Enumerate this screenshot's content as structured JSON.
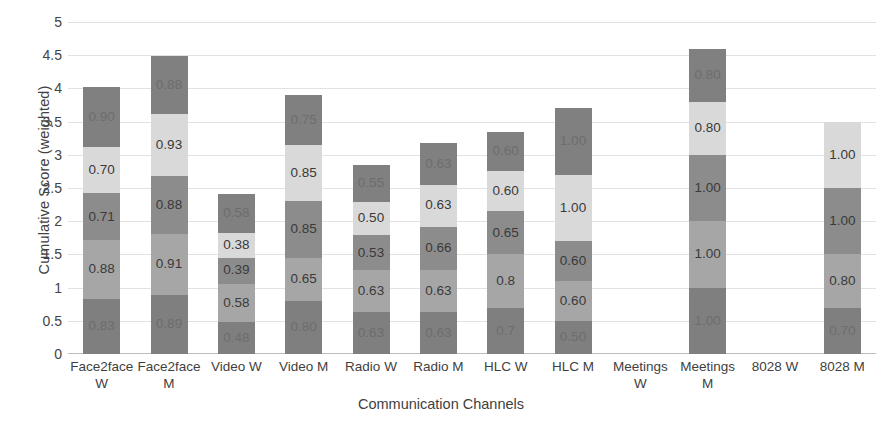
{
  "chart_data": {
    "type": "bar",
    "subtype": "stacked-bar",
    "title": "",
    "xlabel": "Communication Channels",
    "ylabel": "Cumulative Score (weighted)",
    "ylim": [
      0,
      5
    ],
    "ytick_step": 0.5,
    "ytick_labels": [
      "5",
      "4.5",
      "4",
      "3.5",
      "3",
      "2.5",
      "2",
      "1.5",
      "1",
      "0.5",
      "0"
    ],
    "ytick_values": [
      5,
      4.5,
      4,
      3.5,
      3,
      2.5,
      2,
      1.5,
      1,
      0.5,
      0
    ],
    "grid": true,
    "legend": "none",
    "stack_order": "bottom-to-top",
    "series_colors": [
      "#7f7f7f",
      "#a6a6a6",
      "#8c8c8c",
      "#d9d9d9",
      "#808080"
    ],
    "categories": [
      "Face2face W",
      "Face2face M",
      "Video W",
      "Video M",
      "Radio W",
      "Radio M",
      "HLC W",
      "HLC M",
      "Meetings W",
      "Meetings M",
      "8028 W",
      "8028 M"
    ],
    "category_lines": [
      [
        "Face2face",
        "W"
      ],
      [
        "Face2face",
        "M"
      ],
      [
        "Video W"
      ],
      [
        "Video M"
      ],
      [
        "Radio W"
      ],
      [
        "Radio M"
      ],
      [
        "HLC W"
      ],
      [
        "HLC M"
      ],
      [
        "Meetings",
        "W"
      ],
      [
        "Meetings",
        "M"
      ],
      [
        "8028 W"
      ],
      [
        "8028 M"
      ]
    ],
    "bars": [
      {
        "category": "Face2face W",
        "total": 4.02,
        "segments": [
          {
            "value": 0.83,
            "label": "0.83",
            "color": "#7f7f7f",
            "label_dim": true
          },
          {
            "value": 0.88,
            "label": "0.88",
            "color": "#a6a6a6",
            "label_dim": false
          },
          {
            "value": 0.71,
            "label": "0.71",
            "color": "#8c8c8c",
            "label_dim": false
          },
          {
            "value": 0.7,
            "label": "0.70",
            "color": "#d9d9d9",
            "label_dim": false
          },
          {
            "value": 0.9,
            "label": "0.90",
            "color": "#808080",
            "label_dim": true
          }
        ]
      },
      {
        "category": "Face2face M",
        "total": 4.49,
        "segments": [
          {
            "value": 0.89,
            "label": "0.89",
            "color": "#7f7f7f",
            "label_dim": true
          },
          {
            "value": 0.91,
            "label": "0.91",
            "color": "#a6a6a6",
            "label_dim": false
          },
          {
            "value": 0.88,
            "label": "0.88",
            "color": "#8c8c8c",
            "label_dim": false
          },
          {
            "value": 0.93,
            "label": "0.93",
            "color": "#d9d9d9",
            "label_dim": false
          },
          {
            "value": 0.88,
            "label": "0.88",
            "color": "#808080",
            "label_dim": true
          }
        ]
      },
      {
        "category": "Video W",
        "total": 2.41,
        "segments": [
          {
            "value": 0.48,
            "label": "0.48",
            "color": "#7f7f7f",
            "label_dim": true
          },
          {
            "value": 0.58,
            "label": "0.58",
            "color": "#a6a6a6",
            "label_dim": false
          },
          {
            "value": 0.39,
            "label": "0.39",
            "color": "#8c8c8c",
            "label_dim": false
          },
          {
            "value": 0.38,
            "label": "0.38",
            "color": "#d9d9d9",
            "label_dim": false
          },
          {
            "value": 0.58,
            "label": "0.58",
            "color": "#808080",
            "label_dim": true
          }
        ]
      },
      {
        "category": "Video M",
        "total": 3.9,
        "segments": [
          {
            "value": 0.8,
            "label": "0.80",
            "color": "#7f7f7f",
            "label_dim": true
          },
          {
            "value": 0.65,
            "label": "0.65",
            "color": "#a6a6a6",
            "label_dim": false
          },
          {
            "value": 0.85,
            "label": "0.85",
            "color": "#8c8c8c",
            "label_dim": false
          },
          {
            "value": 0.85,
            "label": "0.85",
            "color": "#d9d9d9",
            "label_dim": false
          },
          {
            "value": 0.75,
            "label": "0.75",
            "color": "#808080",
            "label_dim": true
          }
        ]
      },
      {
        "category": "Radio W",
        "total": 2.84,
        "segments": [
          {
            "value": 0.63,
            "label": "0.63",
            "color": "#7f7f7f",
            "label_dim": true
          },
          {
            "value": 0.63,
            "label": "0.63",
            "color": "#a6a6a6",
            "label_dim": false
          },
          {
            "value": 0.53,
            "label": "0.53",
            "color": "#8c8c8c",
            "label_dim": false
          },
          {
            "value": 0.5,
            "label": "0.50",
            "color": "#d9d9d9",
            "label_dim": false
          },
          {
            "value": 0.55,
            "label": "0.55",
            "color": "#808080",
            "label_dim": true
          }
        ]
      },
      {
        "category": "Radio M",
        "total": 3.18,
        "segments": [
          {
            "value": 0.63,
            "label": "0.63",
            "color": "#7f7f7f",
            "label_dim": true
          },
          {
            "value": 0.63,
            "label": "0.63",
            "color": "#a6a6a6",
            "label_dim": false
          },
          {
            "value": 0.66,
            "label": "0.66",
            "color": "#8c8c8c",
            "label_dim": false
          },
          {
            "value": 0.63,
            "label": "0.63",
            "color": "#d9d9d9",
            "label_dim": false
          },
          {
            "value": 0.63,
            "label": "0.63",
            "color": "#808080",
            "label_dim": true
          }
        ]
      },
      {
        "category": "HLC W",
        "total": 3.35,
        "segments": [
          {
            "value": 0.7,
            "label": "0.7",
            "color": "#7f7f7f",
            "label_dim": true
          },
          {
            "value": 0.8,
            "label": "0.8",
            "color": "#a6a6a6",
            "label_dim": false
          },
          {
            "value": 0.65,
            "label": "0.65",
            "color": "#8c8c8c",
            "label_dim": false
          },
          {
            "value": 0.6,
            "label": "0.60",
            "color": "#d9d9d9",
            "label_dim": false
          },
          {
            "value": 0.6,
            "label": "0.60",
            "color": "#808080",
            "label_dim": true
          }
        ]
      },
      {
        "category": "HLC M",
        "total": 3.7,
        "segments": [
          {
            "value": 0.5,
            "label": "0.50",
            "color": "#7f7f7f",
            "label_dim": true
          },
          {
            "value": 0.6,
            "label": "0.60",
            "color": "#a6a6a6",
            "label_dim": false
          },
          {
            "value": 0.6,
            "label": "0.60",
            "color": "#8c8c8c",
            "label_dim": false
          },
          {
            "value": 1.0,
            "label": "1.00",
            "color": "#d9d9d9",
            "label_dim": false
          },
          {
            "value": 1.0,
            "label": "1.00",
            "color": "#808080",
            "label_dim": true
          }
        ]
      },
      {
        "category": "Meetings W",
        "total": 0,
        "segments": []
      },
      {
        "category": "Meetings M",
        "total": 4.6,
        "segments": [
          {
            "value": 1.0,
            "label": "1.00",
            "color": "#7f7f7f",
            "label_dim": true
          },
          {
            "value": 1.0,
            "label": "1.00",
            "color": "#a6a6a6",
            "label_dim": false
          },
          {
            "value": 1.0,
            "label": "1.00",
            "color": "#8c8c8c",
            "label_dim": false
          },
          {
            "value": 0.8,
            "label": "0.80",
            "color": "#d9d9d9",
            "label_dim": false
          },
          {
            "value": 0.8,
            "label": "0.80",
            "color": "#808080",
            "label_dim": true
          }
        ]
      },
      {
        "category": "8028 W",
        "total": 0,
        "segments": []
      },
      {
        "category": "8028 M",
        "total": 3.5,
        "segments": [
          {
            "value": 0.7,
            "label": "0.70",
            "color": "#7f7f7f",
            "label_dim": true
          },
          {
            "value": 0.8,
            "label": "0.80",
            "color": "#a6a6a6",
            "label_dim": false
          },
          {
            "value": 1.0,
            "label": "1.00",
            "color": "#8c8c8c",
            "label_dim": false
          },
          {
            "value": 1.0,
            "label": "1.00",
            "color": "#d9d9d9",
            "label_dim": false
          }
        ]
      }
    ]
  }
}
